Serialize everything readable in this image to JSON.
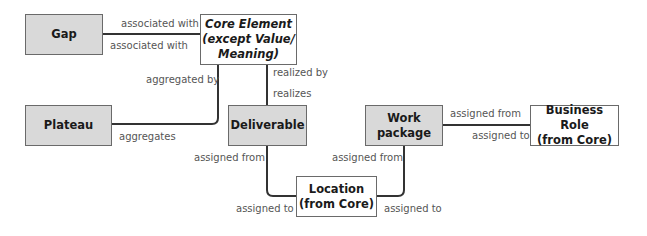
{
  "diagram": {
    "nodes": {
      "gap": {
        "label": "Gap",
        "style": "grey"
      },
      "core": {
        "label_line1": "Core Element",
        "label_line2": "(except Value/",
        "label_line3": "Meaning)",
        "style": "white-italic"
      },
      "plateau": {
        "label": "Plateau",
        "style": "grey"
      },
      "deliverable": {
        "label": "Deliverable",
        "style": "grey"
      },
      "work_package": {
        "label_line1": "Work",
        "label_line2": "package",
        "style": "grey"
      },
      "business_role": {
        "label_line1": "Business Role",
        "label_line2": "(from Core)",
        "style": "white"
      },
      "location": {
        "label_line1": "Location",
        "label_line2": "(from Core)",
        "style": "white"
      }
    },
    "edges": {
      "gap_core": {
        "top": "associated with",
        "bottom": "associated with"
      },
      "core_plateau": {
        "top": "aggregated by",
        "bottom": "aggregates"
      },
      "core_deliverable": {
        "top": "realized by",
        "bottom": "realizes"
      },
      "deliverable_location": {
        "top": "assigned from",
        "bottom": "assigned to"
      },
      "workpackage_location": {
        "top": "assigned from",
        "bottom": "assigned to"
      },
      "workpackage_role": {
        "top": "assigned from",
        "bottom": "assigned to"
      }
    },
    "colors": {
      "grey_fill": "#d9d9d9",
      "border": "#6a6a6a",
      "line": "#333333",
      "label_text": "#555555"
    }
  }
}
